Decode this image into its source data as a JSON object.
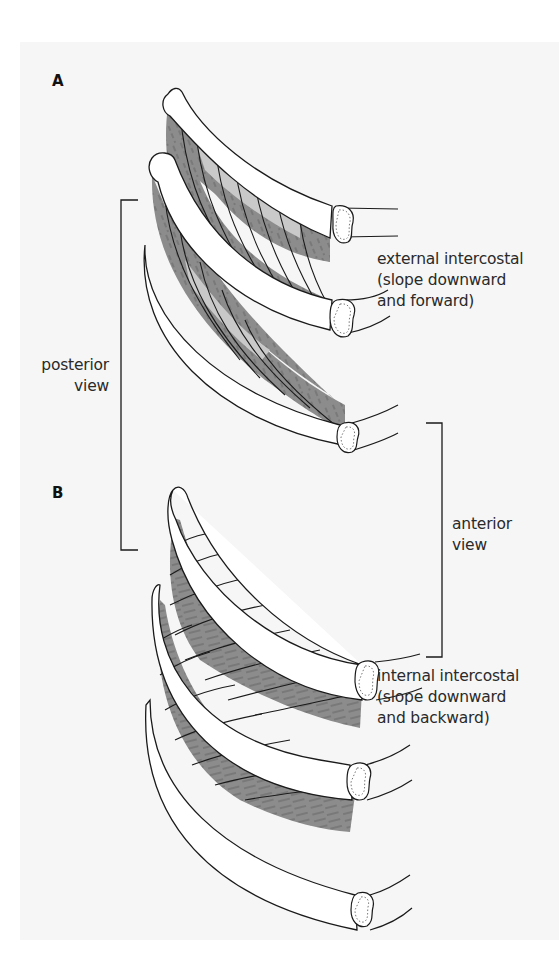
{
  "figure": {
    "panel_a": {
      "letter": "A",
      "muscle_label": {
        "line1": "external intercostal",
        "line2": "(slope downward",
        "line3": "and forward)"
      }
    },
    "panel_b": {
      "letter": "B",
      "muscle_label": {
        "line1": "internal intercostal",
        "line2": "(slope downward",
        "line3": "and backward)"
      }
    },
    "brackets": {
      "posterior": {
        "line1": "posterior",
        "line2": "view"
      },
      "anterior": {
        "line1": "anterior",
        "line2": "view"
      }
    }
  },
  "colors": {
    "background": "#ffffff",
    "panel": "#f6f6f6",
    "muscle_dark": "#8c8c8c",
    "muscle_light": "#c9c9c9",
    "rib_fill": "#ffffff",
    "outline": "#1a1a1a"
  }
}
